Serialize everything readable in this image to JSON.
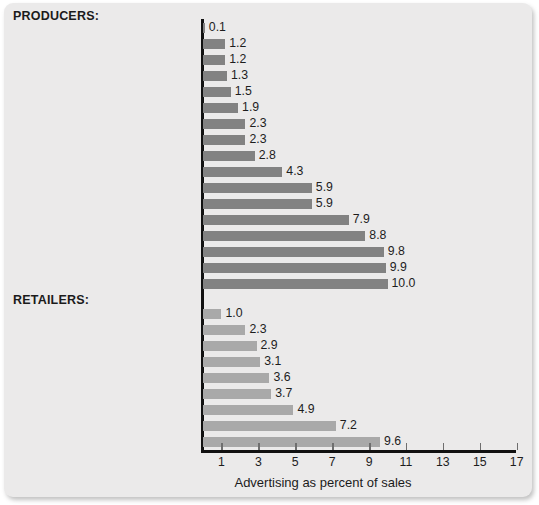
{
  "chart_data": {
    "type": "bar",
    "orientation": "horizontal",
    "title": "",
    "xlabel": "Advertising as percent of sales",
    "ylabel": "",
    "xlim": [
      0,
      17.4
    ],
    "xticks": [
      1,
      3,
      5,
      7,
      9,
      11,
      13,
      15,
      17
    ],
    "grid": false,
    "legend": null,
    "groups": [
      {
        "name": "PRODUCERS:",
        "color": "#828282",
        "categories": [
          "Petroleum refining",
          "Plastic products",
          "Computers and office equipment",
          "Dairy products",
          "Business services",
          "Investment advice",
          "Motor vehicles and car bodies",
          "Cable and other pay TV services",
          "Soft drinks, water",
          "Footwear (except rubber)",
          "Sporting and athletic goods",
          "Sugar and confectionary products",
          "Perfume and cosmetics",
          "Malt beverages",
          "Watches and clocks",
          "Games and toys",
          "Soap and detergent"
        ],
        "values": [
          0.1,
          1.2,
          1.2,
          1.3,
          1.5,
          1.9,
          2.3,
          2.3,
          2.8,
          4.3,
          5.9,
          5.9,
          7.9,
          8.8,
          9.8,
          9.9,
          10.0
        ],
        "value_labels": [
          "0.1",
          "1.2",
          "1.2",
          "1.3",
          "1.5",
          "1.9",
          "2.3",
          "2.3",
          "2.8",
          "4.3",
          "5.9",
          "5.9",
          "7.9",
          "8.8",
          "9.8",
          "9.9",
          "10.0"
        ]
      },
      {
        "name": "RETAILERS:",
        "color": "#a9a9a9",
        "categories": [
          "Grocery stores",
          "Hotels and motels",
          "Eating places",
          "Video tape rental",
          "Catalog, mail-order houses",
          "Women's clothing stores",
          "Jewelry stores",
          "Furniture stores",
          "Amusement parks"
        ],
        "values": [
          1.0,
          2.3,
          2.9,
          3.1,
          3.6,
          3.7,
          4.9,
          7.2,
          9.6
        ],
        "value_labels": [
          "1.0",
          "2.3",
          "2.9",
          "3.1",
          "3.6",
          "3.7",
          "4.9",
          "7.2",
          "9.6"
        ]
      }
    ]
  }
}
